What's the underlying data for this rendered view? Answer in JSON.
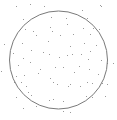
{
  "diagram": {
    "type": "monte-carlo-circle-scatter",
    "width": 117,
    "height": 120,
    "background": "#ffffff",
    "circle": {
      "cx": 58.5,
      "cy": 60,
      "r": 49,
      "stroke": "#7a7a7a",
      "stroke_width": 1
    },
    "point_color": "#9a9a9a",
    "point_size": 1,
    "points": [
      [
        16,
        6
      ],
      [
        30,
        4
      ],
      [
        23,
        19
      ],
      [
        25,
        29
      ],
      [
        33,
        31
      ],
      [
        36,
        35
      ],
      [
        44,
        6
      ],
      [
        51,
        17
      ],
      [
        66,
        18
      ],
      [
        50,
        27
      ],
      [
        67,
        24
      ],
      [
        52,
        31
      ],
      [
        60,
        35
      ],
      [
        73,
        34
      ],
      [
        100,
        5
      ],
      [
        101,
        6
      ],
      [
        82,
        10
      ],
      [
        87,
        18
      ],
      [
        83,
        28
      ],
      [
        93,
        28
      ],
      [
        99,
        29
      ],
      [
        90,
        34
      ],
      [
        4,
        44
      ],
      [
        22,
        43
      ],
      [
        31,
        50
      ],
      [
        13,
        53
      ],
      [
        23,
        58
      ],
      [
        30,
        62
      ],
      [
        1,
        71
      ],
      [
        18,
        65
      ],
      [
        24,
        75
      ],
      [
        16,
        76
      ],
      [
        38,
        73
      ],
      [
        48,
        41
      ],
      [
        70,
        46
      ],
      [
        43,
        52
      ],
      [
        49,
        54
      ],
      [
        59,
        57
      ],
      [
        67,
        55
      ],
      [
        72,
        54
      ],
      [
        40,
        69
      ],
      [
        55,
        67
      ],
      [
        63,
        67
      ],
      [
        74,
        72
      ],
      [
        50,
        78
      ],
      [
        84,
        43
      ],
      [
        96,
        45
      ],
      [
        81,
        54
      ],
      [
        90,
        51
      ],
      [
        88,
        59
      ],
      [
        101,
        60
      ],
      [
        79,
        66
      ],
      [
        89,
        69
      ],
      [
        107,
        63
      ],
      [
        98,
        74
      ],
      [
        113,
        63
      ],
      [
        14,
        82
      ],
      [
        21,
        82
      ],
      [
        26,
        86
      ],
      [
        28,
        92
      ],
      [
        16,
        97
      ],
      [
        31,
        95
      ],
      [
        23,
        108
      ],
      [
        36,
        106
      ],
      [
        53,
        82
      ],
      [
        57,
        84
      ],
      [
        70,
        84
      ],
      [
        68,
        86
      ],
      [
        53,
        99
      ],
      [
        63,
        101
      ],
      [
        49,
        100
      ],
      [
        63,
        111
      ],
      [
        70,
        112
      ],
      [
        87,
        82
      ],
      [
        92,
        83
      ],
      [
        80,
        86
      ],
      [
        102,
        83
      ],
      [
        107,
        84
      ],
      [
        86,
        96
      ],
      [
        92,
        97
      ],
      [
        105,
        96
      ]
    ]
  }
}
